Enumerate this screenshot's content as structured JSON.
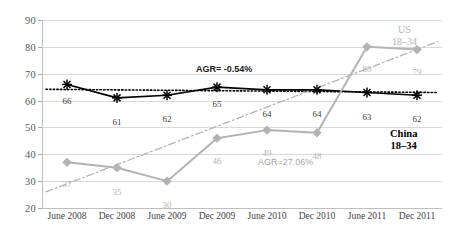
{
  "chart_data": {
    "type": "line",
    "title": "",
    "subtitle": "",
    "xlabel": "",
    "ylabel": "",
    "grid": true,
    "legend_position": "inline-right",
    "ylim": [
      20,
      90
    ],
    "yticks": [
      20,
      30,
      40,
      50,
      60,
      70,
      80,
      90
    ],
    "categories": [
      "June 2008",
      "Dec 2008",
      "June 2009",
      "Dec 2009",
      "June 2010",
      "Dec 2010",
      "June 2011",
      "Dec 2011"
    ],
    "series": [
      {
        "name": "China 18–34",
        "color": "#000000",
        "marker": "asterisk",
        "values": [
          66,
          61,
          62,
          65,
          64,
          64,
          63,
          62
        ],
        "labels": [
          "66",
          "61",
          "62",
          "65",
          "64",
          "64",
          "63",
          "62"
        ]
      },
      {
        "name": "US 18–34",
        "color": "#b3b3b3",
        "marker": "diamond",
        "values": [
          37,
          35,
          30,
          46,
          49,
          48,
          80,
          79
        ],
        "labels": [
          "37",
          "35",
          "30",
          "46",
          "49",
          "48",
          "80",
          "79"
        ]
      }
    ],
    "trendlines": [
      {
        "name": "China trend",
        "style": "dotted",
        "color": "#000000",
        "endpoints": [
          64.2,
          63.0
        ]
      },
      {
        "name": "US trend",
        "style": "dash-dot",
        "color": "#b3b3b3",
        "endpoints": [
          26.0,
          82.0
        ]
      }
    ],
    "annotations": [
      {
        "name": "china-agr",
        "text": "AGR= -0.54%",
        "style": "bold-black"
      },
      {
        "name": "us-agr",
        "text": "AGR=27.06%",
        "style": "gray"
      }
    ]
  },
  "legend": {
    "us_line1": "US",
    "us_line2": "18–34",
    "china_line1": "China",
    "china_line2": "18–34"
  },
  "colors": {
    "china": "#000000",
    "us": "#b3b3b3",
    "grid": "#d9d9d9",
    "axis": "#bfbfbf",
    "tick_text": "#595959"
  }
}
